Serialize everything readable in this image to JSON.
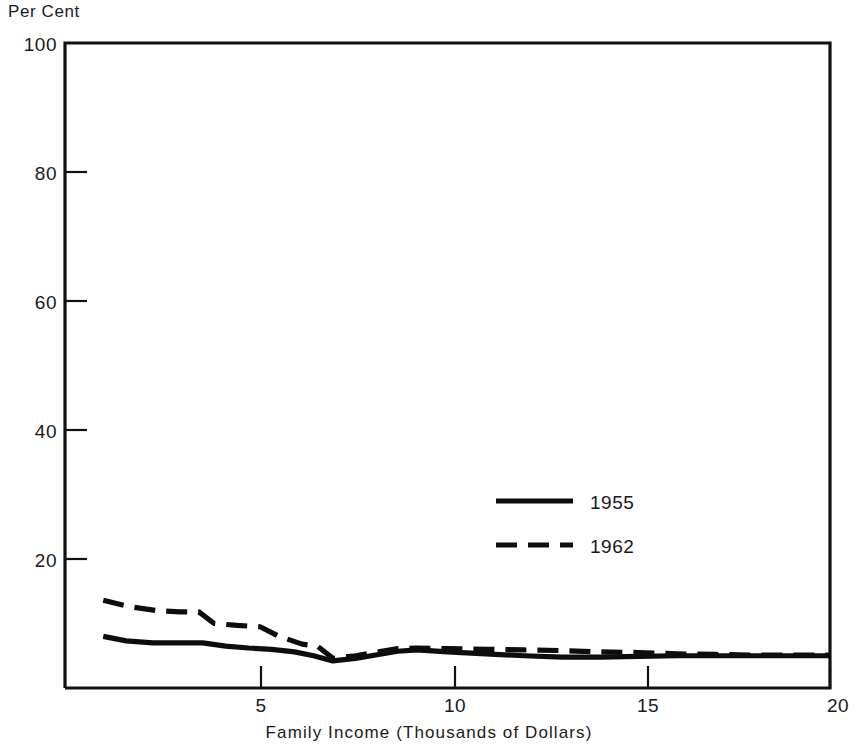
{
  "chart_data": {
    "type": "line",
    "title": "",
    "xlabel": "Family Income (Thousands of Dollars)",
    "ylabel": "Per Cent",
    "xlim": [
      0,
      20
    ],
    "ylim": [
      0,
      100
    ],
    "xticks": [
      5,
      10,
      15,
      20
    ],
    "xtick_labels": [
      "5",
      "10",
      "15",
      "20"
    ],
    "yticks": [
      20,
      40,
      60,
      80,
      100
    ],
    "ytick_labels": [
      "20",
      "40",
      "60",
      "80",
      "100"
    ],
    "grid": false,
    "legend_position": "center-right",
    "series": [
      {
        "name": "1955",
        "style": "solid",
        "x": [
          1.0,
          1.6,
          2.3,
          3.0,
          3.6,
          4.2,
          4.8,
          5.4,
          6.0,
          6.5,
          7.0,
          7.6,
          8.2,
          8.7,
          9.2,
          10.0,
          11.0,
          12.0,
          13.0,
          14.0,
          15.0,
          16.0,
          17.0,
          18.0,
          19.0,
          20.0
        ],
        "values": [
          8.0,
          7.3,
          7.0,
          7.0,
          7.0,
          6.5,
          6.2,
          6.0,
          5.6,
          5.0,
          4.2,
          4.6,
          5.2,
          5.7,
          5.9,
          5.6,
          5.3,
          5.0,
          4.8,
          4.8,
          4.9,
          5.0,
          5.0,
          5.0,
          5.0,
          5.0
        ]
      },
      {
        "name": "1962",
        "style": "dashed",
        "x": [
          1.0,
          1.7,
          2.4,
          3.0,
          3.5,
          3.9,
          4.5,
          5.1,
          5.6,
          6.2,
          6.6,
          7.0,
          7.6,
          8.2,
          8.7,
          9.2,
          10.0,
          11.0,
          12.0,
          13.0,
          14.0,
          15.0,
          16.0,
          17.0,
          18.0,
          19.0,
          20.0
        ],
        "values": [
          13.6,
          12.6,
          12.0,
          11.8,
          11.8,
          10.0,
          9.7,
          9.5,
          8.0,
          6.8,
          6.5,
          4.6,
          5.0,
          5.6,
          6.1,
          6.2,
          6.1,
          6.0,
          5.9,
          5.8,
          5.6,
          5.5,
          5.3,
          5.2,
          5.1,
          5.1,
          5.1
        ]
      }
    ]
  },
  "legend": {
    "entries": [
      {
        "label": "1955",
        "style": "solid"
      },
      {
        "label": "1962",
        "style": "dashed"
      }
    ]
  },
  "colors": {
    "line": "#0d0d0d",
    "frame": "#111111",
    "text": "#1a1a1a",
    "background": "#ffffff"
  }
}
